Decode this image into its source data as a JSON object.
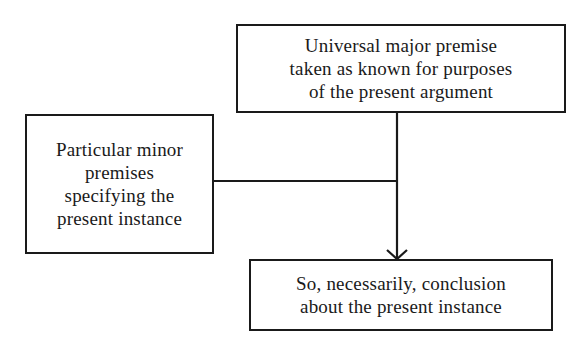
{
  "diagram": {
    "type": "flowchart",
    "nodes": {
      "major_premise": {
        "lines": [
          "Universal major premise",
          "taken as known for purposes",
          "of the present argument"
        ]
      },
      "minor_premises": {
        "lines": [
          "Particular minor",
          "premises",
          "specifying the",
          "present instance"
        ]
      },
      "conclusion": {
        "lines": [
          "So, necessarily, conclusion",
          "about the present instance"
        ]
      }
    },
    "edges": [
      {
        "from": "major_premise",
        "to": "conclusion",
        "style": "arrow"
      },
      {
        "from": "minor_premises",
        "to": "major_premise-conclusion-line",
        "style": "line-join"
      }
    ],
    "colors": {
      "stroke": "#1a1a1a",
      "background": "#ffffff"
    }
  }
}
